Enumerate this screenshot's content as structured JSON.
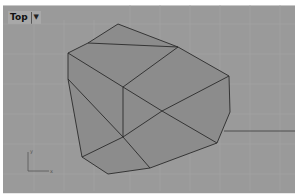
{
  "viewport": {
    "title": "Top",
    "dropdown_icon": "triangle-down",
    "background": "#9a9a9a",
    "grid_color": "#a3a3a3",
    "face_color": "#8a8a8a",
    "edge_color": "#2a2a2a",
    "axis_labels": {
      "x": "x",
      "y": "y"
    }
  }
}
